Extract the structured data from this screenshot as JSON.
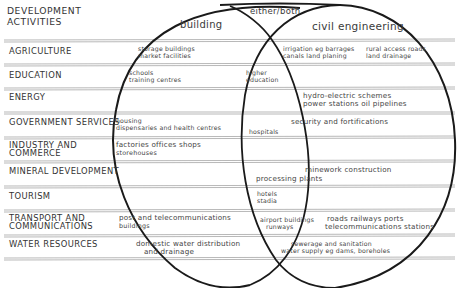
{
  "header": {
    "line1": "DEVELOPMENT",
    "line2": "ACTIVITIES"
  },
  "sets": {
    "building": "building",
    "overlap": "either/both",
    "civil": "civil engineering"
  },
  "rows": [
    {
      "label": "AGRICULTURE"
    },
    {
      "label": "EDUCATION"
    },
    {
      "label": "ENERGY"
    },
    {
      "label": "GOVERNMENT SERVICES"
    },
    {
      "label1": "INDUSTRY AND",
      "label2": "COMMERCE"
    },
    {
      "label": "MINERAL DEVELOPMENT"
    },
    {
      "label": "TOURISM"
    },
    {
      "label1": "TRANSPORT AND",
      "label2": "COMMUNICATIONS"
    },
    {
      "label": "WATER RESOURCES"
    }
  ],
  "cells": {
    "agriculture": {
      "building": [
        "storage buildings",
        "market facilities"
      ],
      "civil_a": [
        "irrigation eg barrages",
        "canals land planing"
      ],
      "civil_b": [
        "rural access roads",
        "land drainage"
      ]
    },
    "education": {
      "building": [
        "schools",
        "training centres"
      ],
      "both": [
        "higher",
        "education"
      ]
    },
    "energy": {
      "civil": [
        "hydro-electric schemes",
        "power stations oil pipelines"
      ]
    },
    "government": {
      "building": [
        "housing",
        "dispensaries and health centres"
      ],
      "both": [
        "hospitals"
      ],
      "civil": [
        "security and fortifications"
      ]
    },
    "industry": {
      "building": [
        "factories offices shops",
        "storehouses"
      ]
    },
    "mineral": {
      "civil": [
        "minework construction"
      ],
      "both": [
        "processing plants"
      ]
    },
    "tourism": {
      "both": [
        "hotels",
        "stadia"
      ]
    },
    "transport": {
      "building": [
        "post and telecommunications",
        "buildings"
      ],
      "both": [
        "airport buildings",
        "runways"
      ],
      "civil": [
        "roads railways ports",
        "telecommunications stations"
      ]
    },
    "water": {
      "building": [
        "domestic water distribution",
        "and drainage"
      ],
      "civil": [
        "sewerage and sanitation",
        "water supply eg dams, boreholes"
      ]
    }
  },
  "colors": {
    "ink": "#1a1a1a",
    "rule": "#8a8a8a",
    "text": "#3a3a3a",
    "background": "#ffffff"
  }
}
